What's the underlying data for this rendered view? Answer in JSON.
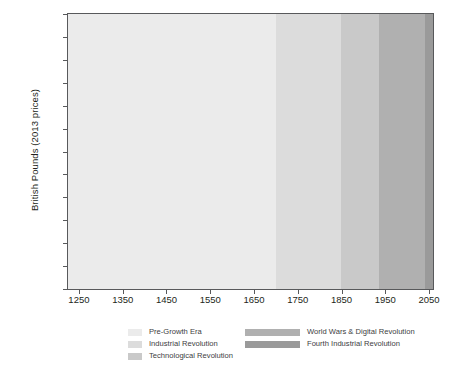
{
  "chart_data": {
    "type": "line",
    "title": "",
    "xlabel": "",
    "ylabel": "British Pounds (2013 prices)",
    "xlim": [
      1225,
      2059
    ],
    "ylim": [
      0,
      30000
    ],
    "grid": false,
    "legend_position": "bottom",
    "xticks": [
      1250,
      1350,
      1450,
      1550,
      1650,
      1750,
      1850,
      1950,
      2050
    ],
    "yticks": [
      0,
      2500,
      5000,
      7500,
      10000,
      12500,
      15000,
      17500,
      20000,
      22500,
      25000,
      27500,
      30000
    ],
    "line_color": "#000000",
    "series": [
      {
        "name": "GDP per capita",
        "x": [
          1270,
          1280,
          1290,
          1300,
          1310,
          1320,
          1330,
          1340,
          1350,
          1360,
          1370,
          1380,
          1390,
          1400,
          1410,
          1420,
          1430,
          1440,
          1450,
          1460,
          1470,
          1480,
          1490,
          1500,
          1510,
          1520,
          1530,
          1540,
          1550,
          1560,
          1570,
          1580,
          1590,
          1600,
          1610,
          1620,
          1630,
          1640,
          1650,
          1660,
          1670,
          1680,
          1690,
          1700,
          1710,
          1720,
          1730,
          1740,
          1750,
          1760,
          1770,
          1780,
          1790,
          1800,
          1810,
          1820,
          1830,
          1840,
          1850,
          1860,
          1870,
          1880,
          1890,
          1900,
          1910,
          1920,
          1930,
          1940,
          1945,
          1950,
          1960,
          1970,
          1980,
          1990,
          2000,
          2008,
          2013
        ],
        "values": [
          690,
          700,
          715,
          720,
          735,
          745,
          760,
          770,
          800,
          830,
          845,
          880,
          900,
          930,
          950,
          960,
          975,
          985,
          1000,
          1010,
          1020,
          1030,
          1040,
          1050,
          1040,
          1055,
          1060,
          1065,
          1070,
          1080,
          1090,
          1100,
          1095,
          1120,
          1150,
          1180,
          1210,
          1240,
          1280,
          1320,
          1360,
          1400,
          1460,
          1500,
          1520,
          1560,
          1620,
          1610,
          1700,
          1740,
          1780,
          1820,
          1900,
          2000,
          2050,
          2150,
          2350,
          2500,
          2700,
          3000,
          3400,
          3800,
          4200,
          4700,
          5100,
          5000,
          5600,
          6900,
          6600,
          7300,
          9000,
          11500,
          13500,
          17000,
          22500,
          28700,
          26900
        ]
      }
    ],
    "bands": [
      {
        "label": "Pre-Growth Era",
        "from": 1225,
        "to": 1700,
        "color": "#ebebeb"
      },
      {
        "label": "Industrial Revolution",
        "from": 1700,
        "to": 1848,
        "color": "#dcdcdc"
      },
      {
        "label": "Technological Revolution",
        "from": 1848,
        "to": 1935,
        "color": "#c9c9c9"
      },
      {
        "label": "World Wars & Digital Revolution",
        "from": 1935,
        "to": 2040,
        "color": "#b0b0b0"
      },
      {
        "label": "Fourth Industrial Revolution",
        "from": 2040,
        "to": 2059,
        "color": "#9a9a9a"
      }
    ]
  },
  "legend": {
    "left_column": [
      {
        "label": "Pre-Growth Era",
        "color": "#ebebeb"
      },
      {
        "label": "Industrial Revolution",
        "color": "#dcdcdc"
      },
      {
        "label": "Technological Revolution",
        "color": "#c9c9c9"
      }
    ],
    "right_column": [
      {
        "label": "World Wars & Digital Revolution",
        "color": "#b0b0b0"
      },
      {
        "label": "Fourth Industrial Revolution",
        "color": "#9a9a9a"
      }
    ]
  }
}
